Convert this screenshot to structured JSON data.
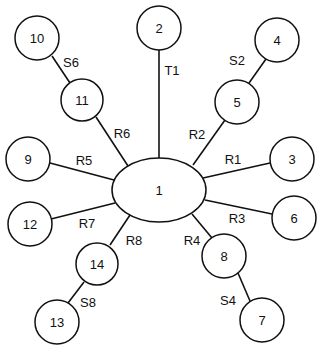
{
  "diagram": {
    "type": "star-network",
    "hub": {
      "id": "1",
      "label": "1",
      "cx": 159,
      "cy": 190,
      "rx": 47,
      "ry": 32
    },
    "nodes": [
      {
        "id": "2",
        "label": "2",
        "cx": 159,
        "cy": 28,
        "r": 22
      },
      {
        "id": "3",
        "label": "3",
        "cx": 292,
        "cy": 159,
        "r": 22
      },
      {
        "id": "4",
        "label": "4",
        "cx": 277,
        "cy": 40,
        "r": 22
      },
      {
        "id": "5",
        "label": "5",
        "cx": 237,
        "cy": 102,
        "r": 22
      },
      {
        "id": "6",
        "label": "6",
        "cx": 294,
        "cy": 218,
        "r": 22
      },
      {
        "id": "7",
        "label": "7",
        "cx": 262,
        "cy": 320,
        "r": 22
      },
      {
        "id": "8",
        "label": "8",
        "cx": 224,
        "cy": 256,
        "r": 22
      },
      {
        "id": "9",
        "label": "9",
        "cx": 28,
        "cy": 159,
        "r": 22
      },
      {
        "id": "10",
        "label": "10",
        "cx": 37,
        "cy": 38,
        "r": 22
      },
      {
        "id": "11",
        "label": "11",
        "cx": 82,
        "cy": 100,
        "r": 21
      },
      {
        "id": "12",
        "label": "12",
        "cx": 30,
        "cy": 224,
        "r": 22
      },
      {
        "id": "13",
        "label": "13",
        "cx": 57,
        "cy": 322,
        "r": 22
      },
      {
        "id": "14",
        "label": "14",
        "cx": 97,
        "cy": 264,
        "r": 21
      }
    ],
    "edges": [
      {
        "id": "T1",
        "label": "T1",
        "from": "1",
        "to": "2",
        "x1": 159,
        "y1": 158,
        "x2": 159,
        "y2": 50,
        "lx": 172,
        "ly": 70
      },
      {
        "id": "R1",
        "label": "R1",
        "from": "1",
        "to": "3",
        "x1": 203,
        "y1": 178,
        "x2": 270,
        "y2": 163,
        "lx": 233,
        "ly": 159
      },
      {
        "id": "R2",
        "label": "R2",
        "from": "1",
        "to": "5",
        "x1": 193,
        "y1": 165,
        "x2": 225,
        "y2": 120,
        "lx": 197,
        "ly": 134
      },
      {
        "id": "S2",
        "label": "S2",
        "from": "5",
        "to": "4",
        "x1": 249,
        "y1": 83,
        "x2": 266,
        "y2": 59,
        "lx": 237,
        "ly": 60
      },
      {
        "id": "R3",
        "label": "R3",
        "from": "1",
        "to": "6",
        "x1": 205,
        "y1": 200,
        "x2": 272,
        "y2": 214,
        "lx": 237,
        "ly": 218
      },
      {
        "id": "R4",
        "label": "R4",
        "from": "1",
        "to": "8",
        "x1": 192,
        "y1": 214,
        "x2": 212,
        "y2": 238,
        "lx": 192,
        "ly": 240
      },
      {
        "id": "S4",
        "label": "S4",
        "from": "8",
        "to": "7",
        "x1": 238,
        "y1": 273,
        "x2": 250,
        "y2": 301,
        "lx": 228,
        "ly": 300
      },
      {
        "id": "R5",
        "label": "R5",
        "from": "1",
        "to": "9",
        "x1": 114,
        "y1": 180,
        "x2": 50,
        "y2": 163,
        "lx": 84,
        "ly": 160
      },
      {
        "id": "R6",
        "label": "R6",
        "from": "1",
        "to": "11",
        "x1": 128,
        "y1": 166,
        "x2": 96,
        "y2": 117,
        "lx": 122,
        "ly": 133
      },
      {
        "id": "S6",
        "label": "S6",
        "from": "11",
        "to": "10",
        "x1": 70,
        "y1": 83,
        "x2": 52,
        "y2": 56,
        "lx": 71,
        "ly": 62
      },
      {
        "id": "R7",
        "label": "R7",
        "from": "1",
        "to": "12",
        "x1": 115,
        "y1": 203,
        "x2": 51,
        "y2": 219,
        "lx": 87,
        "ly": 223
      },
      {
        "id": "R8",
        "label": "R8",
        "from": "1",
        "to": "14",
        "x1": 130,
        "y1": 215,
        "x2": 110,
        "y2": 245,
        "lx": 134,
        "ly": 240
      },
      {
        "id": "S8",
        "label": "S8",
        "from": "14",
        "to": "13",
        "x1": 84,
        "y1": 282,
        "x2": 68,
        "y2": 303,
        "lx": 88,
        "ly": 302
      }
    ]
  }
}
